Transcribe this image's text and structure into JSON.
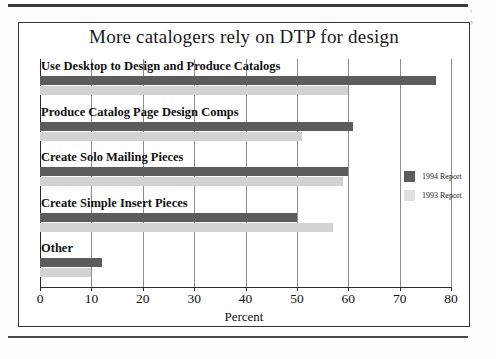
{
  "page": {
    "margin_note_line1": "t",
    "margin_note_line2": "p"
  },
  "chart_data": {
    "type": "bar",
    "orientation": "horizontal",
    "title": "More catalogers rely on DTP for design",
    "xlabel": "Percent",
    "ylabel": "",
    "xlim": [
      0,
      80
    ],
    "xticks": [
      "0",
      "10",
      "20",
      "30",
      "40",
      "50",
      "60",
      "70",
      "80"
    ],
    "grid": true,
    "legend_position": "right",
    "categories": [
      "Use Desktop to Design and Produce Catalogs",
      "Produce Catalog Page Design Comps",
      "Create Solo Mailing Pieces",
      "Create Simple Insert Pieces",
      "Other"
    ],
    "series": [
      {
        "name": "1994 Report",
        "color": "#5c5c5c",
        "values": [
          77,
          61,
          60,
          50,
          12
        ]
      },
      {
        "name": "1993 Report",
        "color": "#d2d2d2",
        "values": [
          60,
          51,
          59,
          57,
          10
        ]
      }
    ]
  }
}
